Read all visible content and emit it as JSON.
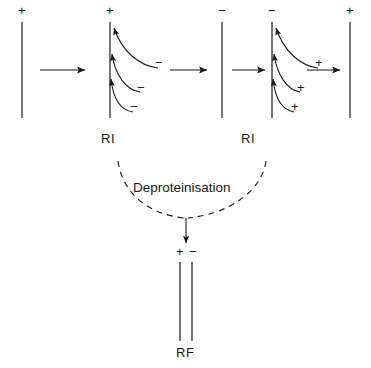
{
  "diagram": {
    "type": "process-schematic",
    "title_text": "",
    "charge_symbols": {
      "plus": "+",
      "minus": "−"
    },
    "panels": [
      {
        "id": "panel-1",
        "name": "single-strand-plus",
        "top_charge": "+",
        "strand_count": 1,
        "arrows": [],
        "label": ""
      },
      {
        "id": "panel-2",
        "name": "replicative-intermediate-minus-release",
        "top_charge": "+",
        "strand_count": 1,
        "arrow_count": 3,
        "arrow_charges": [
          "−",
          "−",
          "−"
        ],
        "label": "RI"
      },
      {
        "id": "panel-3",
        "name": "single-strand-minus",
        "top_charge": "−",
        "strand_count": 1,
        "arrows": [],
        "label": ""
      },
      {
        "id": "panel-4",
        "name": "replicative-intermediate-plus-release",
        "top_charge": "−",
        "strand_count": 1,
        "arrow_count": 3,
        "arrow_charges": [
          "+",
          "+",
          "+"
        ],
        "label": "RI"
      },
      {
        "id": "panel-5",
        "name": "single-strand-plus-final",
        "top_charge": "+",
        "strand_count": 1,
        "arrows": [],
        "label": ""
      }
    ],
    "step_arrows": [
      {
        "id": "arrow-1",
        "from": "panel-1",
        "to": "panel-2"
      },
      {
        "id": "arrow-2",
        "from": "panel-2",
        "to": "panel-3"
      },
      {
        "id": "arrow-3",
        "from": "panel-3",
        "to": "panel-4"
      },
      {
        "id": "arrow-4",
        "from": "panel-4",
        "to": "panel-5"
      }
    ],
    "process": {
      "label": "Deproteinisation",
      "style": "dashed-converging-curves",
      "source_labels": [
        "RI",
        "RI"
      ],
      "target": "RF"
    },
    "product": {
      "id": "panel-rf",
      "name": "replicative-form",
      "label": "RF",
      "strand_count": 2,
      "top_charges": [
        "+",
        "−"
      ]
    },
    "colors": {
      "stroke": "#1a1a1a",
      "text": "#1a1a1a",
      "background": "#ffffff"
    }
  }
}
